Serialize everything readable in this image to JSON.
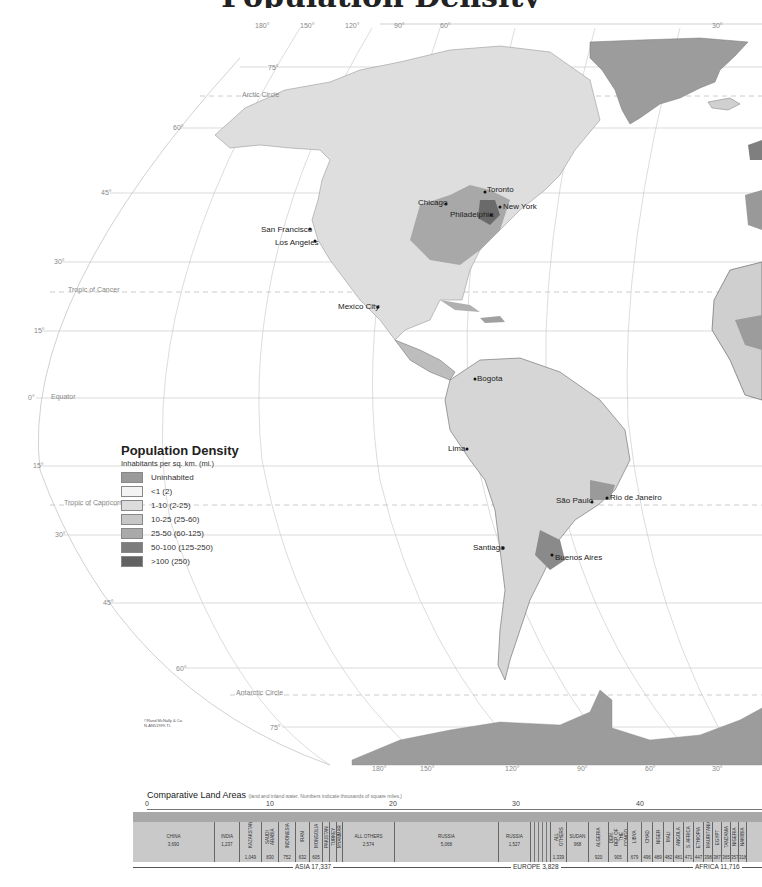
{
  "map": {
    "longitude_labels_top": [
      "180°",
      "150°",
      "120°",
      "90°",
      "60°",
      "30°"
    ],
    "longitude_labels_bottom": [
      "180°",
      "150°",
      "120°",
      "90°",
      "60°",
      "30°"
    ],
    "latitude_labels": [
      "75°",
      "60°",
      "45°",
      "30°",
      "15°",
      "0°",
      "15°",
      "30°",
      "45°",
      "60°",
      "75°"
    ],
    "special_lines": {
      "arctic_circle": "Arctic Circle",
      "tropic_of_cancer": "Tropic of Cancer",
      "equator": "Equator",
      "tropic_of_capricorn": "Tropic of Capricorn",
      "antarctic_circle": "Antarctic Circle"
    },
    "cities": [
      {
        "name": "Toronto"
      },
      {
        "name": "Chicago"
      },
      {
        "name": "New York"
      },
      {
        "name": "Philadelphia"
      },
      {
        "name": "San Francisco"
      },
      {
        "name": "Los Angeles"
      },
      {
        "name": "Mexico City"
      },
      {
        "name": "Bogota"
      },
      {
        "name": "Lima"
      },
      {
        "name": "São Paulo"
      },
      {
        "name": "Rio de Janeiro"
      },
      {
        "name": "Santiago"
      },
      {
        "name": "Buenos Aires"
      }
    ],
    "copyright": [
      "©Rand McNally & Co.",
      "N-AN51999-TI-"
    ]
  },
  "legend": {
    "title": "Population Density",
    "subtitle": "Inhabitants per sq. km. (mi.)",
    "items": [
      {
        "label": "Uninhabited",
        "color": "#9a9a9a"
      },
      {
        "label": "<1 (2)",
        "color": "#f3f3f3"
      },
      {
        "label": "1-10 (2-25)",
        "color": "#dcdcdc"
      },
      {
        "label": "10-25 (25-60)",
        "color": "#c6c6c6"
      },
      {
        "label": "25-50 (60-125)",
        "color": "#a9a9a9"
      },
      {
        "label": "50-100 (125-250)",
        "color": "#7c7c7c"
      },
      {
        "label": ">100 (250)",
        "color": "#626262"
      }
    ]
  },
  "comparative_land_areas": {
    "title": "Comparative Land Areas",
    "note": "(land and inland water. Numbers indicate thousands of square miles.)",
    "scale_ticks": [
      "0",
      "10",
      "20",
      "30",
      "40"
    ],
    "segments": [
      {
        "name": "CHINA",
        "value": "3,690"
      },
      {
        "name": "INDIA",
        "value": "1,237"
      },
      {
        "name": "KAZAKSTAN",
        "value": "1,049"
      },
      {
        "name": "SAUDI ARABIA",
        "value": "830"
      },
      {
        "name": "INDONESIA",
        "value": "752"
      },
      {
        "name": "IRAN",
        "value": "632"
      },
      {
        "name": "MONGOLIA",
        "value": "605"
      },
      {
        "name": "PAKISTAN",
        "value": "340"
      },
      {
        "name": "TURKEY",
        "value": ""
      },
      {
        "name": "MYANMAR",
        "value": ""
      },
      {
        "name": "ALL OTHERS",
        "value": "2,574"
      },
      {
        "name": "RUSSIA",
        "value": "5,068"
      },
      {
        "name": "RUSSIA",
        "value": "1,527"
      },
      {
        "name": "ALL OTHERS",
        "value": "1,339"
      },
      {
        "name": "SUDAN",
        "value": "968"
      },
      {
        "name": "ALGERIA",
        "value": "920"
      },
      {
        "name": "DEM. REP. OF THE CONGO",
        "value": "905"
      },
      {
        "name": "LIBYA",
        "value": "679"
      },
      {
        "name": "CHAD",
        "value": "496"
      },
      {
        "name": "NIGER",
        "value": "489"
      },
      {
        "name": "MALI",
        "value": "482"
      },
      {
        "name": "ANGOLA",
        "value": "481"
      },
      {
        "name": "S. AFRICA",
        "value": "471"
      },
      {
        "name": "ETHIOPIA",
        "value": "447"
      },
      {
        "name": "MAURITANIA",
        "value": "398"
      },
      {
        "name": "EGYPT",
        "value": "387"
      },
      {
        "name": "TANZANIA",
        "value": "365"
      },
      {
        "name": "NIGERIA",
        "value": "357"
      },
      {
        "name": "NAMIBIA",
        "value": "318"
      }
    ],
    "groups": [
      {
        "label": "ASIA 17,337"
      },
      {
        "label": "EUROPE 3,828"
      },
      {
        "label": "AFRICA 11,716"
      }
    ]
  }
}
